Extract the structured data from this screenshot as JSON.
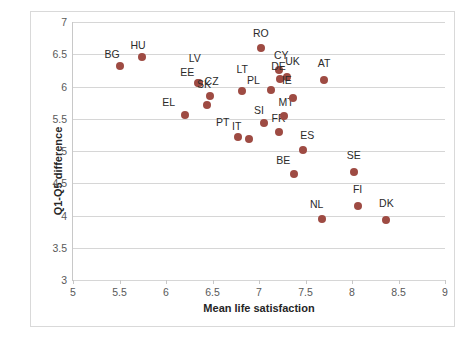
{
  "chart_data": {
    "type": "scatter",
    "title": "",
    "xlabel": "Mean life satisfaction",
    "ylabel": "Q1-Q5 difference",
    "xlim": [
      5,
      9
    ],
    "ylim": [
      3,
      7
    ],
    "xticks": [
      5,
      5.5,
      6,
      6.5,
      7,
      7.5,
      8,
      8.5,
      9
    ],
    "yticks": [
      3,
      3.5,
      4,
      4.5,
      5,
      5.5,
      6,
      6.5,
      7
    ],
    "xtick_labels": [
      "5",
      "5.5",
      "6",
      "6.5",
      "7",
      "7.5",
      "8",
      "8.5",
      "9"
    ],
    "ytick_labels": [
      "3",
      "3.5",
      "4",
      "4.5",
      "5",
      "5.5",
      "6",
      "6.5",
      "7"
    ],
    "grid": "horizontal",
    "legend": "none",
    "marker_color": "#9e4b43",
    "points": [
      {
        "label": "BG",
        "x": 5.5,
        "y": 6.32,
        "lx": -0.08,
        "ly": 0.12
      },
      {
        "label": "HU",
        "x": 5.74,
        "y": 6.45,
        "lx": -0.04,
        "ly": 0.13
      },
      {
        "label": "EL",
        "x": 6.2,
        "y": 5.56,
        "lx": -0.17,
        "ly": 0.13
      },
      {
        "label": "EE",
        "x": 6.34,
        "y": 6.05,
        "lx": -0.11,
        "ly": 0.11
      },
      {
        "label": "LV",
        "x": 6.36,
        "y": 6.06,
        "lx": -0.05,
        "ly": 0.32
      },
      {
        "label": "SK",
        "x": 6.44,
        "y": 5.72,
        "lx": -0.03,
        "ly": 0.26
      },
      {
        "label": "CZ",
        "x": 6.47,
        "y": 5.85,
        "lx": 0.02,
        "ly": 0.17
      },
      {
        "label": "LT",
        "x": 6.82,
        "y": 5.93,
        "lx": 0.0,
        "ly": 0.28
      },
      {
        "label": "PT",
        "x": 6.77,
        "y": 5.22,
        "lx": -0.16,
        "ly": 0.17
      },
      {
        "label": "IT",
        "x": 6.89,
        "y": 5.18,
        "lx": -0.13,
        "ly": 0.14
      },
      {
        "label": "RO",
        "x": 7.02,
        "y": 6.6,
        "lx": 0.0,
        "ly": 0.17
      },
      {
        "label": "SI",
        "x": 7.05,
        "y": 5.43,
        "lx": -0.05,
        "ly": 0.15
      },
      {
        "label": "PL",
        "x": 7.13,
        "y": 5.95,
        "lx": -0.19,
        "ly": 0.09
      },
      {
        "label": "CY",
        "x": 7.22,
        "y": 6.26,
        "lx": 0.02,
        "ly": 0.16
      },
      {
        "label": "DE",
        "x": 7.23,
        "y": 6.12,
        "lx": -0.02,
        "ly": 0.13
      },
      {
        "label": "FR",
        "x": 7.22,
        "y": 5.3,
        "lx": -0.01,
        "ly": 0.15
      },
      {
        "label": "MT",
        "x": 7.27,
        "y": 5.55,
        "lx": 0.02,
        "ly": 0.15
      },
      {
        "label": "UK",
        "x": 7.3,
        "y": 6.15,
        "lx": 0.06,
        "ly": 0.18
      },
      {
        "label": "IE",
        "x": 7.37,
        "y": 5.82,
        "lx": -0.07,
        "ly": 0.22
      },
      {
        "label": "BE",
        "x": 7.38,
        "y": 4.65,
        "lx": -0.12,
        "ly": 0.15
      },
      {
        "label": "ES",
        "x": 7.47,
        "y": 5.02,
        "lx": 0.05,
        "ly": 0.17
      },
      {
        "label": "AT",
        "x": 7.7,
        "y": 6.1,
        "lx": 0.0,
        "ly": 0.2
      },
      {
        "label": "NL",
        "x": 7.68,
        "y": 3.95,
        "lx": -0.06,
        "ly": 0.17
      },
      {
        "label": "SE",
        "x": 8.02,
        "y": 4.67,
        "lx": 0.0,
        "ly": 0.2
      },
      {
        "label": "FI",
        "x": 8.06,
        "y": 4.15,
        "lx": 0.0,
        "ly": 0.2
      },
      {
        "label": "DK",
        "x": 8.37,
        "y": 3.93,
        "lx": 0.0,
        "ly": 0.2
      }
    ]
  }
}
